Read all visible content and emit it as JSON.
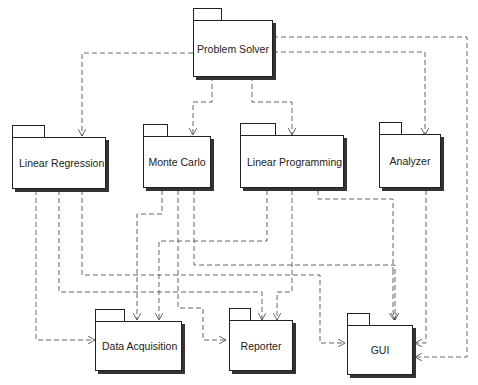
{
  "diagram": {
    "type": "uml-package-diagram",
    "packages": [
      {
        "id": "problem_solver",
        "label": "Problem Solver"
      },
      {
        "id": "linear_regression",
        "label": "Linear Regression"
      },
      {
        "id": "monte_carlo",
        "label": "Monte Carlo"
      },
      {
        "id": "linear_programming",
        "label": "Linear Programming"
      },
      {
        "id": "analyzer",
        "label": "Analyzer"
      },
      {
        "id": "data_acquisition",
        "label": "Data Acquisition"
      },
      {
        "id": "reporter",
        "label": "Reporter"
      },
      {
        "id": "gui",
        "label": "GUI"
      }
    ],
    "dependencies": [
      {
        "from": "Problem Solver",
        "to": "Linear Regression"
      },
      {
        "from": "Problem Solver",
        "to": "Monte Carlo"
      },
      {
        "from": "Problem Solver",
        "to": "Linear Programming"
      },
      {
        "from": "Problem Solver",
        "to": "Analyzer"
      },
      {
        "from": "Problem Solver",
        "to": "GUI"
      },
      {
        "from": "Linear Regression",
        "to": "Data Acquisition"
      },
      {
        "from": "Linear Regression",
        "to": "Reporter"
      },
      {
        "from": "Linear Regression",
        "to": "GUI"
      },
      {
        "from": "Monte Carlo",
        "to": "Data Acquisition"
      },
      {
        "from": "Monte Carlo",
        "to": "Reporter"
      },
      {
        "from": "Monte Carlo",
        "to": "GUI"
      },
      {
        "from": "Linear Programming",
        "to": "Data Acquisition"
      },
      {
        "from": "Linear Programming",
        "to": "Reporter"
      },
      {
        "from": "Linear Programming",
        "to": "GUI"
      },
      {
        "from": "Analyzer",
        "to": "GUI"
      }
    ],
    "line_style": "dashed",
    "arrow_style": "open",
    "colors": {
      "line": "#555555",
      "box_border": "#222222",
      "shadow": "#333333",
      "background": "#ffffff"
    }
  }
}
